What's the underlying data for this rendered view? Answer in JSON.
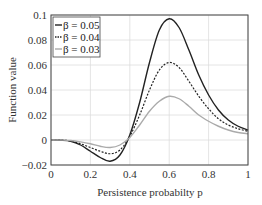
{
  "chart_data": {
    "type": "line",
    "title": "",
    "xlabel": "Persistence  probabilty p",
    "ylabel": "Function value",
    "xlim": [
      0,
      1
    ],
    "ylim": [
      -0.02,
      0.1
    ],
    "xticks": [
      "0",
      "0.2",
      "0.4",
      "0.6",
      "0.8",
      "1"
    ],
    "yticks": [
      "-0.02",
      "0",
      "0.02",
      "0.04",
      "0.06",
      "0.08",
      "0.1"
    ],
    "grid": true,
    "legend_position": "upper left",
    "x": [
      0,
      0.05,
      0.1,
      0.15,
      0.2,
      0.25,
      0.3,
      0.35,
      0.4,
      0.45,
      0.5,
      0.55,
      0.6,
      0.65,
      0.7,
      0.75,
      0.8,
      0.85,
      0.9,
      0.95,
      1.0
    ],
    "series": [
      {
        "name": "β = 0.05",
        "style": "solid",
        "color": "#222222",
        "values": [
          0,
          -0.0002,
          -0.001,
          -0.004,
          -0.009,
          -0.014,
          -0.017,
          -0.012,
          0.004,
          0.03,
          0.062,
          0.088,
          0.097,
          0.09,
          0.072,
          0.052,
          0.036,
          0.024,
          0.016,
          0.011,
          0.008
        ]
      },
      {
        "name": "β = 0.04",
        "style": "dotted",
        "color": "#222222",
        "values": [
          0,
          -0.0001,
          -0.0007,
          -0.003,
          -0.006,
          -0.009,
          -0.011,
          -0.008,
          0.003,
          0.02,
          0.04,
          0.056,
          0.062,
          0.058,
          0.047,
          0.035,
          0.025,
          0.017,
          0.012,
          0.009,
          0.007
        ]
      },
      {
        "name": "β = 0.03",
        "style": "solid",
        "color": "#aaaaaa",
        "values": [
          0,
          -0.0001,
          -0.0004,
          -0.0015,
          -0.003,
          -0.005,
          -0.006,
          -0.004,
          0.002,
          0.012,
          0.023,
          0.031,
          0.035,
          0.033,
          0.027,
          0.02,
          0.015,
          0.011,
          0.008,
          0.006,
          0.005
        ]
      }
    ]
  }
}
